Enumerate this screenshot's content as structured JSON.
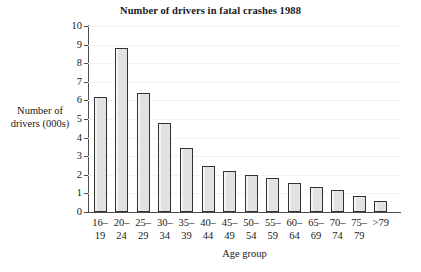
{
  "chart_data": {
    "type": "bar",
    "title": "Number of drivers in fatal crashes 1988",
    "xlabel": "Age group",
    "ylabel_lines": [
      "Number of",
      "drivers (000s)"
    ],
    "ylabel": "Number of drivers (000s)",
    "categories": [
      "16–19",
      "20–24",
      "25–29",
      "30–34",
      "35–39",
      "40–44",
      "45–49",
      "50–54",
      "55–59",
      "60–64",
      "65–69",
      "70–74",
      "75–79",
      ">79"
    ],
    "category_lines": [
      [
        "16–",
        "19"
      ],
      [
        "20–",
        "24"
      ],
      [
        "25–",
        "29"
      ],
      [
        "30–",
        "34"
      ],
      [
        "35–",
        "39"
      ],
      [
        "40–",
        "44"
      ],
      [
        "45–",
        "49"
      ],
      [
        "50–",
        "54"
      ],
      [
        "55–",
        "59"
      ],
      [
        "60–",
        "64"
      ],
      [
        "65–",
        "69"
      ],
      [
        "70–",
        "74"
      ],
      [
        "75–",
        "79"
      ],
      [
        ">79",
        ""
      ]
    ],
    "values": [
      6.2,
      8.8,
      6.4,
      4.8,
      3.45,
      2.5,
      2.2,
      2.0,
      1.85,
      1.55,
      1.35,
      1.2,
      0.85,
      0.6
    ],
    "ylim": [
      0,
      10
    ],
    "ytick_labels": [
      "0",
      "1",
      "2",
      "3",
      "4",
      "5",
      "6",
      "7",
      "8",
      "9",
      "10"
    ],
    "ytick_values": [
      0,
      1,
      2,
      3,
      4,
      5,
      6,
      7,
      8,
      9,
      10
    ],
    "grid": true,
    "legend": false,
    "bar_fill_color": "#e2e2e2",
    "bar_edge_color": "#333333",
    "axis_color": "#4d4d4d",
    "gridline_color": "#f2f2f2",
    "background_color": "#ffffff"
  }
}
